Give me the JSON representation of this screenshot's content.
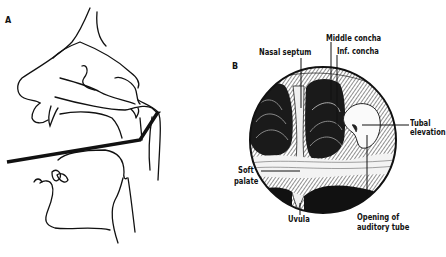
{
  "figure": {
    "panel_a": {
      "label": "A",
      "description": "Sagittal view of head showing mirror/instrument passed through mouth to nasopharynx"
    },
    "panel_b": {
      "label": "B",
      "description": "Posterior rhinoscopy view of nasopharynx",
      "labels": {
        "nasal_septum": "Nasal septum",
        "middle_concha": "Middle concha",
        "inf_concha": "Inf. concha",
        "tubal_elevation_1": "Tubal",
        "tubal_elevation_2": "elevation",
        "soft_palate_1": "Soft",
        "soft_palate_2": "palate",
        "uvula": "Uvula",
        "opening_1": "Opening of",
        "opening_2": "auditory tube"
      }
    }
  }
}
